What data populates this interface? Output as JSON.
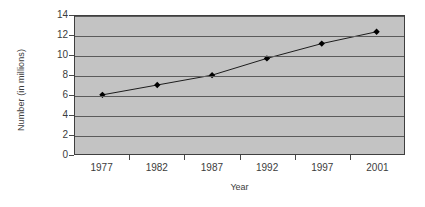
{
  "chart_data": {
    "type": "line",
    "title": "",
    "xlabel": "Year",
    "ylabel": "Number (in millions)",
    "categories": [
      "1977",
      "1982",
      "1987",
      "1992",
      "1997",
      "2001"
    ],
    "values": [
      6.0,
      7.0,
      8.0,
      9.7,
      11.2,
      12.4
    ],
    "series": [
      {
        "name": "Number (in millions)",
        "values": [
          6.0,
          7.0,
          8.0,
          9.7,
          11.2,
          12.4
        ]
      }
    ],
    "ylim": [
      0,
      14
    ],
    "y_ticks": [
      0,
      2,
      4,
      6,
      8,
      10,
      12,
      14
    ],
    "y_tick_labels": [
      "0",
      "2",
      "4",
      "6",
      "8",
      "10",
      "12",
      "14"
    ],
    "grid": "horizontal",
    "legend": "none",
    "marker": "diamond",
    "colors": {
      "plot_background": "#c3c3c3",
      "figure_background": "#ffffff",
      "gridline": "#5b5b5b",
      "axis": "#3f3f3f",
      "series_line": "#1a1a1a",
      "marker_fill": "#000000",
      "text": "#3c3c3c"
    }
  }
}
